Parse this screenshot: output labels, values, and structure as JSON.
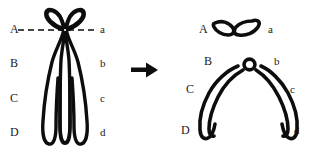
{
  "figure": {
    "type": "diagram",
    "background_color": "#ffffff",
    "ink_color": "#0d0d0d",
    "label_color": "#1a1a1a"
  },
  "left_panel": {
    "name": "bivalent-with-chiasma",
    "description": "Bivalent chromosome with crossed loops at top and two long parallel arms; horizontal dashed line marks the break plane",
    "labels_left": [
      {
        "text": "A",
        "x": 10,
        "y": 23
      },
      {
        "text": "B",
        "x": 10,
        "y": 57
      },
      {
        "text": "C",
        "x": 10,
        "y": 92
      },
      {
        "text": "D",
        "x": 10,
        "y": 126
      }
    ],
    "labels_right": [
      {
        "text": "a",
        "x": 100,
        "y": 23
      },
      {
        "text": "b",
        "x": 100,
        "y": 57
      },
      {
        "text": "c",
        "x": 100,
        "y": 92
      },
      {
        "text": "d",
        "x": 100,
        "y": 126
      }
    ],
    "dashed_line": {
      "name": "break-plane",
      "x1": 18,
      "x2": 96,
      "y": 30,
      "dash": "6 4"
    }
  },
  "arrow": {
    "name": "transformation-arrow",
    "direction": "right",
    "x": 131,
    "y": 70
  },
  "right_panel": {
    "fragment": {
      "name": "detached-fragment",
      "description": "Small shallow wing-shaped fragment with two loops",
      "labels": [
        {
          "text": "A",
          "x": 199,
          "y": 30
        },
        {
          "text": "a",
          "x": 268,
          "y": 30
        }
      ]
    },
    "chromosome": {
      "name": "inverted-v-chromosome",
      "description": "Large inverted V chromosome with small open centromere ring at apex",
      "labels_left": [
        {
          "text": "B",
          "x": 204,
          "y": 60
        },
        {
          "text": "C",
          "x": 186,
          "y": 88
        },
        {
          "text": "D",
          "x": 181,
          "y": 126
        }
      ],
      "labels_right": [
        {
          "text": "b",
          "x": 274,
          "y": 60
        },
        {
          "text": "c",
          "x": 290,
          "y": 88
        },
        {
          "text": "d",
          "x": 294,
          "y": 126
        }
      ]
    }
  }
}
